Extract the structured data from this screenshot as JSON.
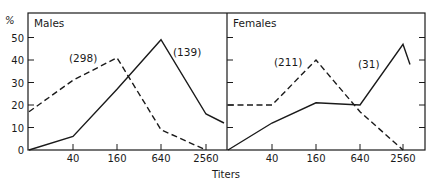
{
  "chart_data": [
    {
      "type": "line",
      "title": "Males",
      "xlabel": "Titers",
      "ylabel": "%",
      "categories": [
        "0",
        "40",
        "160",
        "640",
        "2560",
        ">2560"
      ],
      "x_tick_labels": [
        "40",
        "160",
        "640",
        "2560"
      ],
      "ylim": [
        0,
        55
      ],
      "y_ticks": [
        0,
        10,
        20,
        30,
        40,
        50
      ],
      "series": [
        {
          "name": "dashed (298)",
          "style": "dashed",
          "annotation": "(298)",
          "values": [
            17,
            31,
            41,
            9,
            0,
            null
          ]
        },
        {
          "name": "solid (139)",
          "style": "solid",
          "annotation": "(139)",
          "values": [
            0,
            6,
            27,
            49,
            16,
            12
          ]
        }
      ]
    },
    {
      "type": "line",
      "title": "Females",
      "xlabel": "Titers",
      "ylabel": "%",
      "categories": [
        "0",
        "40",
        "160",
        "640",
        "2560",
        ">2560"
      ],
      "x_tick_labels": [
        "40",
        "160",
        "640",
        "2560"
      ],
      "ylim": [
        0,
        55
      ],
      "y_ticks": [
        0,
        10,
        20,
        30,
        40,
        50
      ],
      "series": [
        {
          "name": "dashed (211)",
          "style": "dashed",
          "annotation": "(211)",
          "values": [
            20,
            20,
            40,
            17,
            0,
            null
          ]
        },
        {
          "name": "solid (31)",
          "style": "solid",
          "annotation": "(31)",
          "values": [
            0,
            12,
            21,
            20,
            47,
            38
          ]
        }
      ]
    }
  ],
  "labels": {
    "y_unit": "%",
    "x_axis_title": "Titers",
    "males_title": "Males",
    "females_title": "Females",
    "y_ticks": [
      "0",
      "10",
      "20",
      "30",
      "40",
      "50"
    ],
    "x_ticks": [
      "40",
      "160",
      "640",
      "2560"
    ],
    "males_dashed_ann": "(298)",
    "males_solid_ann": "(139)",
    "females_dashed_ann": "(211)",
    "females_solid_ann": "(31)"
  }
}
